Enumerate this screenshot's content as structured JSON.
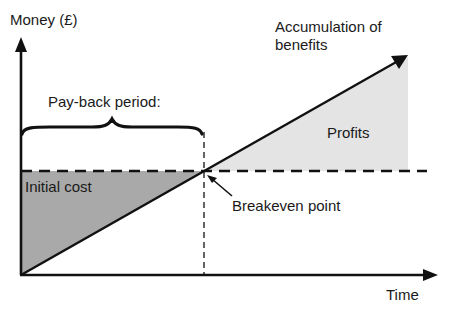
{
  "labels": {
    "y_axis": "Money (£)",
    "x_axis": "Time",
    "accumulation_line1": "Accumulation of",
    "accumulation_line2": "benefits",
    "payback": "Pay-back period:",
    "profits": "Profits",
    "initial_cost": "Initial cost",
    "breakeven": "Breakeven point"
  },
  "colors": {
    "stroke": "#111111",
    "initial_cost_fill": "#a9a9a9",
    "profits_fill": "#e4e4e4",
    "background": "#ffffff"
  },
  "geometry": {
    "origin": [
      21,
      275
    ],
    "y_axis_top": [
      21,
      37
    ],
    "x_axis_end": [
      438,
      275
    ],
    "benefit_line_end": [
      408,
      55
    ],
    "breakeven": [
      204,
      171
    ],
    "cost_line_y": 171,
    "cost_line_x_end": 427
  }
}
